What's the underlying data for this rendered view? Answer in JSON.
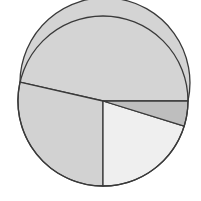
{
  "canvas": {
    "width": 201,
    "height": 201,
    "background": "#ffffff"
  },
  "chart_data": {
    "type": "pie",
    "title": "",
    "subtitle": "",
    "xlabel": "",
    "ylabel": "",
    "grid": false,
    "legend": "none",
    "annotations": [],
    "center": {
      "x": 103,
      "y": 101
    },
    "radius": 85,
    "start_angle_deg": 0,
    "direction": "clockwise",
    "outline_color": "#3a3a3a",
    "outline_width": 1.3,
    "total": 100,
    "categories": [
      "Slice 1",
      "Slice 2",
      "Slice 3",
      "Slice 4"
    ],
    "values": [
      53.5,
      21.5,
      20.2,
      4.8
    ],
    "angles_deg": [
      192.6,
      77.4,
      72.7,
      17.3
    ],
    "colors": [
      "#d4d4d4",
      "#d2d2d2",
      "#efefef",
      "#bebebe"
    ],
    "tick_labels": [],
    "slices": [
      {
        "label": "Slice 1",
        "value": 53.5,
        "angle_deg": 192.6,
        "start_deg": 0,
        "end_deg": 192.6,
        "color": "#d4d4d4",
        "path": "M 103 101 L 188 101 A 85 85 0 1 0 19.97 82.17 Z"
      },
      {
        "label": "Slice 2",
        "value": 21.5,
        "angle_deg": 77.4,
        "start_deg": 192.6,
        "end_deg": 270,
        "color": "#d2d2d2",
        "path": "M 103 101 L 19.97 82.17 A 85 85 0 0 0 103 186 Z"
      },
      {
        "label": "Slice 3",
        "value": 20.2,
        "angle_deg": 72.7,
        "start_deg": 270,
        "end_deg": 342.7,
        "color": "#efefef",
        "path": "M 103 101 L 103 186 A 85 85 0 0 0 184.15 126.24 Z"
      },
      {
        "label": "Slice 4",
        "value": 4.8,
        "angle_deg": 17.3,
        "start_deg": 342.7,
        "end_deg": 360,
        "color": "#bebebe",
        "path": "M 103 101 L 184.15 126.24 A 85 85 0 0 0 188 101 Z"
      }
    ]
  }
}
